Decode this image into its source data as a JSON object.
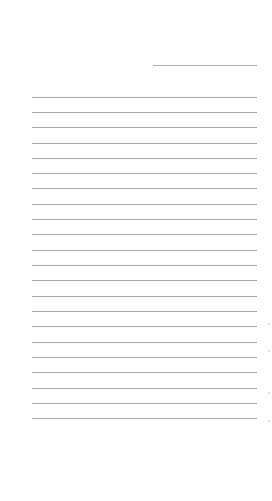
{
  "document": {
    "type": "lined-paper",
    "background_color": "#fefefe",
    "line_color": "#a9a9a9",
    "header_line": {
      "x1": 153,
      "x2": 257,
      "y": 65
    },
    "ruled_lines": {
      "count": 22,
      "x1": 32,
      "x2": 257,
      "y_positions": [
        97,
        112,
        127,
        143,
        158,
        173,
        188,
        204,
        219,
        234,
        250,
        265,
        280,
        296,
        311,
        326,
        342,
        357,
        372,
        388,
        403,
        418
      ]
    }
  }
}
